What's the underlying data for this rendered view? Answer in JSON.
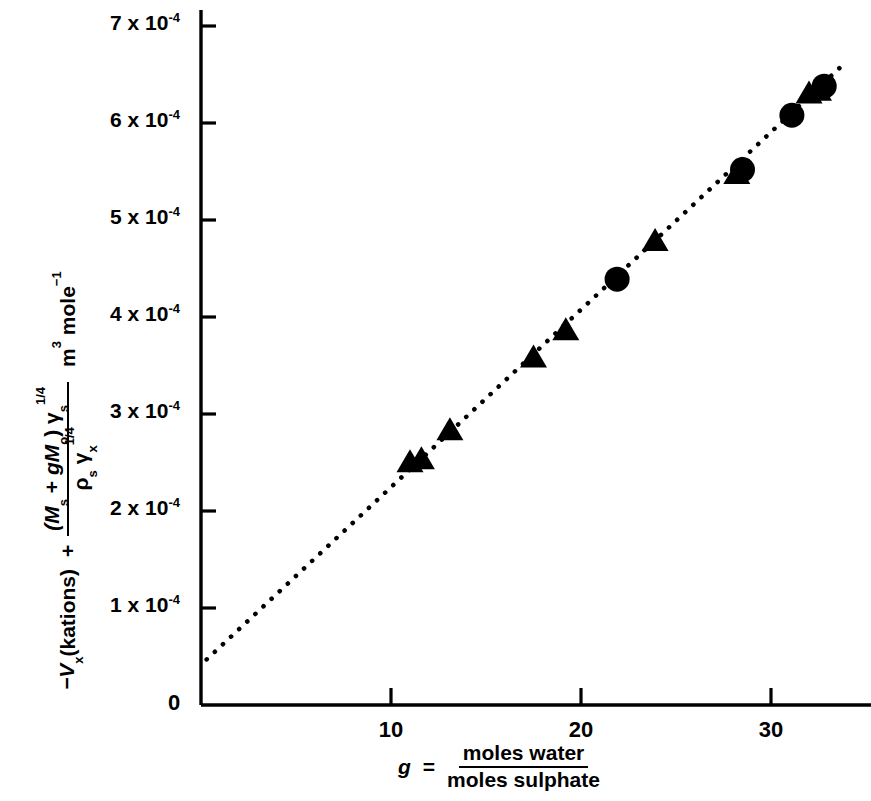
{
  "figure": {
    "background_color": "#ffffff",
    "ink_color": "#000000"
  },
  "yaxis": {
    "label_parts": {
      "minus_v": "−V",
      "v_sub": "x",
      "kations": " (kations)",
      "plus": "+",
      "num_open": "(M",
      "num_sub_s": "s",
      "num_plus": " + ",
      "num_gm": "gM",
      "num_sub_o": "o",
      "num_close": ") γ",
      "num_gamma_sub": "s",
      "num_gamma_sup": "1/4",
      "den_rho": "ρ",
      "den_rho_sub": "s",
      "den_gamma": "γ",
      "den_gamma_sub": "x",
      "den_gamma_sup": "1/4",
      "units_m": "m",
      "units_m_sup": "3",
      "units_mole": " mole",
      "units_mole_sup": "−1"
    },
    "ticks": [
      {
        "value": 1,
        "label_mantissa": "1 x 10",
        "label_exponent": "-4"
      },
      {
        "value": 2,
        "label_mantissa": "2 x 10",
        "label_exponent": "-4"
      },
      {
        "value": 3,
        "label_mantissa": "3 x 10",
        "label_exponent": "-4"
      },
      {
        "value": 4,
        "label_mantissa": "4 x 10",
        "label_exponent": "-4"
      },
      {
        "value": 5,
        "label_mantissa": "5 x 10",
        "label_exponent": "-4"
      },
      {
        "value": 6,
        "label_mantissa": "6 x 10",
        "label_exponent": "-4"
      },
      {
        "value": 7,
        "label_mantissa": "7 x 10",
        "label_exponent": "-4"
      }
    ],
    "origin_label": "0"
  },
  "xaxis": {
    "label_parts": {
      "g": "g",
      "equals": "=",
      "numerator": "moles water",
      "denominator": "moles sulphate"
    },
    "ticks": [
      {
        "value": 10,
        "label": "10"
      },
      {
        "value": 20,
        "label": "20"
      },
      {
        "value": 30,
        "label": "30"
      }
    ]
  },
  "chart_data": {
    "type": "scatter",
    "title": "",
    "subtitle": "",
    "xlabel": "g = moles water / moles sulphate",
    "ylabel": "-Vx (kations) + (Ms + gMo) γs^1/4 / ρs γx^1/4   m3 mole-1",
    "xlim": [
      0,
      35.5
    ],
    "ylim": [
      0,
      7.2
    ],
    "y_scale_factor": "1e-4",
    "grid": false,
    "legend": false,
    "legend_position": "none",
    "series": [
      {
        "name": "triangles",
        "marker": "triangle",
        "color": "#000000",
        "points": [
          {
            "x": 11.0,
            "y": 2.5
          },
          {
            "x": 11.6,
            "y": 2.53
          },
          {
            "x": 13.1,
            "y": 2.83
          },
          {
            "x": 17.5,
            "y": 3.58
          },
          {
            "x": 19.2,
            "y": 3.86
          },
          {
            "x": 23.9,
            "y": 4.78
          },
          {
            "x": 28.2,
            "y": 5.47
          },
          {
            "x": 32.0,
            "y": 6.3
          },
          {
            "x": 32.5,
            "y": 6.33
          }
        ]
      },
      {
        "name": "circles",
        "marker": "circle",
        "color": "#000000",
        "points": [
          {
            "x": 21.9,
            "y": 4.39
          },
          {
            "x": 28.5,
            "y": 5.52
          },
          {
            "x": 31.1,
            "y": 6.08
          },
          {
            "x": 32.8,
            "y": 6.38
          }
        ]
      }
    ],
    "fit_line": {
      "name": "dotted-trend-line",
      "style": "dotted",
      "color": "#000000",
      "x_start": 0.3,
      "y_start": 0.47,
      "x_end": 33.9,
      "y_end": 6.62
    }
  }
}
